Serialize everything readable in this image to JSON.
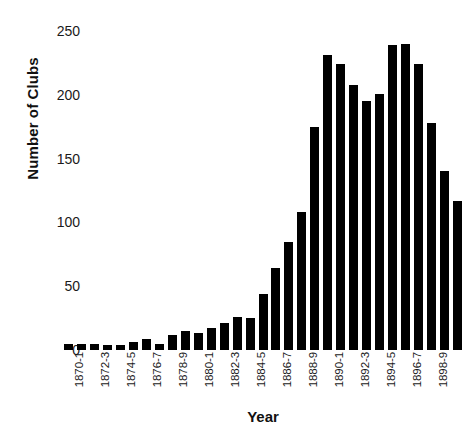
{
  "chart_data": {
    "type": "bar",
    "title": "",
    "xlabel": "Year",
    "ylabel": "Number of Clubs",
    "ylim": [
      0,
      250
    ],
    "yticks": [
      0,
      50,
      100,
      150,
      200,
      250
    ],
    "grid": false,
    "legend": null,
    "bar_color": "#000000",
    "background_color": "#ffffff",
    "categories": [
      "1870-1",
      "1871-2",
      "1872-3",
      "1873-4",
      "1874-5",
      "1875-6",
      "1876-7",
      "1877-8",
      "1878-9",
      "1879-80",
      "1880-1",
      "1881-2",
      "1882-3",
      "1883-4",
      "1884-5",
      "1885-6",
      "1886-7",
      "1887-8",
      "1888-9",
      "1889-90",
      "1890-1",
      "1891-2",
      "1892-3",
      "1893-4",
      "1894-5",
      "1895-6",
      "1896-7",
      "1897-8",
      "1898-9",
      "1899-1900"
    ],
    "tick_labels": [
      "1870-1",
      "",
      "1872-3",
      "",
      "1874-5",
      "",
      "1876-7",
      "",
      "1878-9",
      "",
      "1880-1",
      "",
      "1882-3",
      "",
      "1884-5",
      "",
      "1886-7",
      "",
      "1888-9",
      "",
      "1890-1",
      "",
      "1892-3",
      "",
      "1894-5",
      "",
      "1896-7",
      "",
      "1898-9",
      ""
    ],
    "values": [
      5,
      5,
      5,
      4,
      4,
      6,
      9,
      5,
      12,
      15,
      13,
      17,
      21,
      26,
      25,
      44,
      64,
      85,
      108,
      175,
      231,
      224,
      208,
      195,
      201,
      239,
      240,
      224,
      178,
      140
    ],
    "values_tail": 117
  }
}
